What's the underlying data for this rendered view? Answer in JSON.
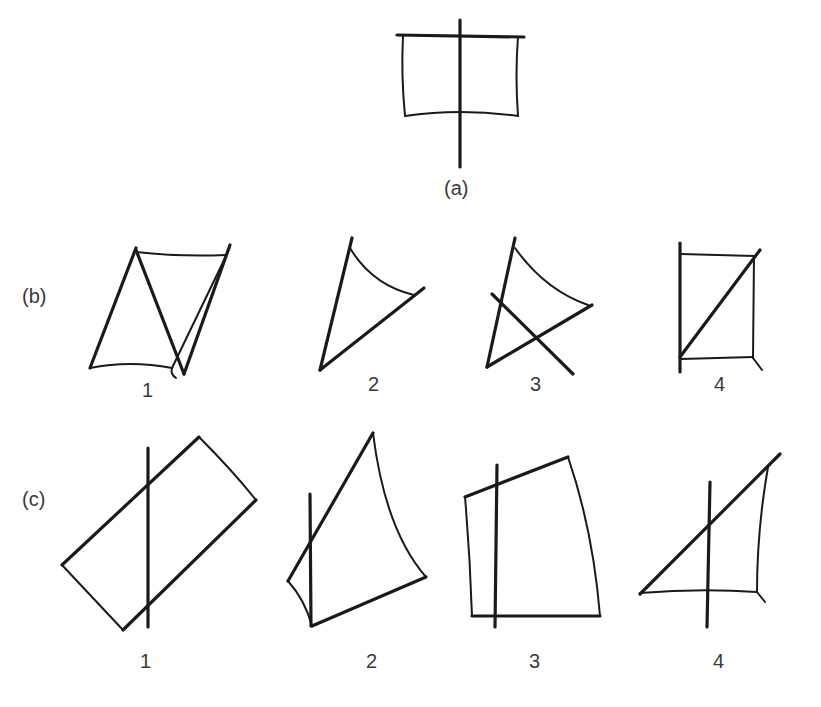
{
  "figure": {
    "panels": [
      {
        "id": "a",
        "label": "(a)"
      },
      {
        "id": "b",
        "label": "(b)",
        "options": [
          "1",
          "2",
          "3",
          "4"
        ]
      },
      {
        "id": "c",
        "label": "(c)",
        "options": [
          "1",
          "2",
          "3",
          "4"
        ]
      }
    ]
  },
  "colors": {
    "stroke": "#1a1a1a",
    "text": "#3a3a3a",
    "background": "#ffffff"
  }
}
